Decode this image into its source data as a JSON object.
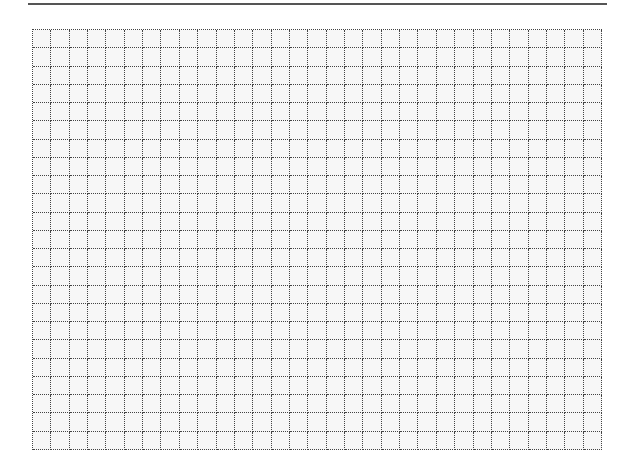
{
  "page": {
    "type": "blank dotted grid sheet",
    "background_color": "#ffffff",
    "top_rule": {
      "color": "#555555",
      "thickness_px": 2
    },
    "grid": {
      "columns": 31,
      "rows": 23,
      "line_style": "dotted",
      "line_color": "#444444",
      "cell_fill": "#f7f7f7"
    }
  }
}
